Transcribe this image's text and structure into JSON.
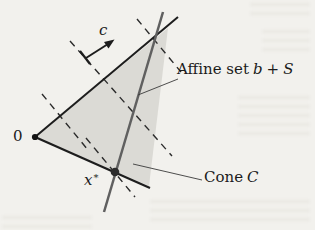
{
  "figure": {
    "type": "math-diagram",
    "background_color": "#f2f1ed",
    "colors": {
      "cone_fill": "#dbdad5",
      "edge": "#1d1d1d",
      "affine_line": "#606060",
      "dashed_line": "#2b2b2b",
      "pointer_line": "#3a3a3a",
      "origin_dot": "#141414",
      "xstar_dot": "#2c2c2c",
      "text": "#1b1b1b"
    },
    "labels": {
      "origin": "0",
      "c_vector": "c",
      "xstar_base": "x",
      "xstar_sup": "*",
      "affine_prefix": "Affine set",
      "affine_b": "b",
      "affine_plus": "+",
      "affine_S": "S",
      "cone_prefix": "Cone",
      "cone_C": "C"
    }
  }
}
